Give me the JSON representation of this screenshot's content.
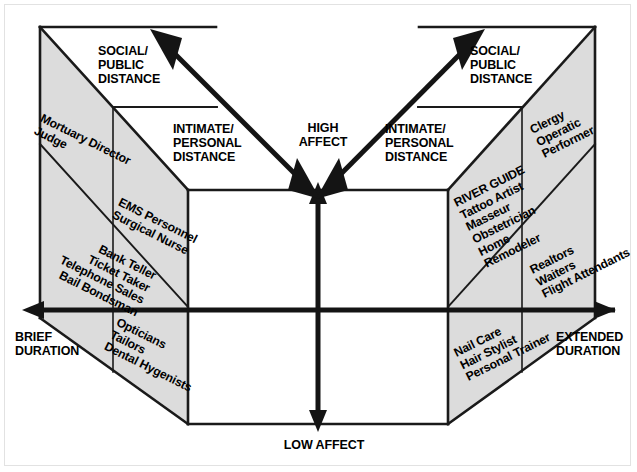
{
  "diagram": {
    "title_axes": {
      "high_affect": "HIGH\nAFFECT",
      "low_affect": "LOW AFFECT",
      "brief_duration": "BRIEF\nDURATION",
      "extended_duration": "EXTENDED\nDURATION"
    },
    "distance_labels": {
      "left_social": "SOCIAL/\nPUBLIC\nDISTANCE",
      "left_intimate": "INTIMATE/\nPERSONAL\nDISTANCE",
      "right_social": "SOCIAL/\nPUBLIC\nDISTANCE",
      "right_intimate": "INTIMATE/\nPERSONAL\nDISTANCE"
    },
    "occupations": {
      "left_outer_upper": "Mortuary Director\nJudge",
      "left_outer_lower": "Bank Teller\nTicket Taker\nTelephone Sales\nBail Bondsman",
      "left_inner_upper": "EMS Personnel\nSurgical Nurse",
      "left_inner_lower": "Opticians\nTailors\nDental Hygenists",
      "right_inner_upper": "RIVER GUIDE\nTattoo Artist\nMasseur\nObstetrician\nHome\nRemodeler",
      "right_inner_lower": "Nail Care\nHair Stylist\nPersonal Trainer",
      "right_outer_upper": "Clergy\nOperatic\nPerformer",
      "right_outer_lower": "Realtors\nWaiters\nFlight Attendants"
    },
    "colors": {
      "panel_shade": "#dcdcdc",
      "line": "#1a1a1a",
      "background": "#ffffff",
      "frame": "#e2e2e2"
    }
  }
}
